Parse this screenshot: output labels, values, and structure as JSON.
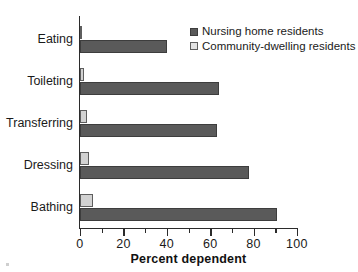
{
  "chart_data": {
    "type": "bar",
    "orientation": "horizontal",
    "title": "",
    "xlabel": "Percent dependent",
    "ylabel": "",
    "categories": [
      "Eating",
      "Toileting",
      "Transferring",
      "Dressing",
      "Bathing"
    ],
    "series": [
      {
        "name": "Nursing home residents",
        "color": "#5a5a5a",
        "values": [
          40,
          64,
          63,
          78,
          91
        ]
      },
      {
        "name": "Community-dwelling residents",
        "color": "#d2d2d2",
        "values": [
          1,
          2,
          3,
          4,
          6
        ]
      }
    ],
    "xlim": [
      0,
      100
    ],
    "xticks": [
      0,
      20,
      40,
      60,
      80,
      100
    ],
    "xtick_labels": [
      "0",
      "20",
      "40",
      "60",
      "80",
      "100"
    ],
    "minor_xticks": [
      10,
      30,
      50,
      70,
      90
    ],
    "grid": false,
    "legend_position": "top-right"
  },
  "legend": {
    "items": [
      {
        "label": "Nursing home residents",
        "swatch": "nursing"
      },
      {
        "label": "Community-dwelling residents",
        "swatch": "community"
      }
    ]
  },
  "axis": {
    "x_title": "Percent dependent"
  }
}
